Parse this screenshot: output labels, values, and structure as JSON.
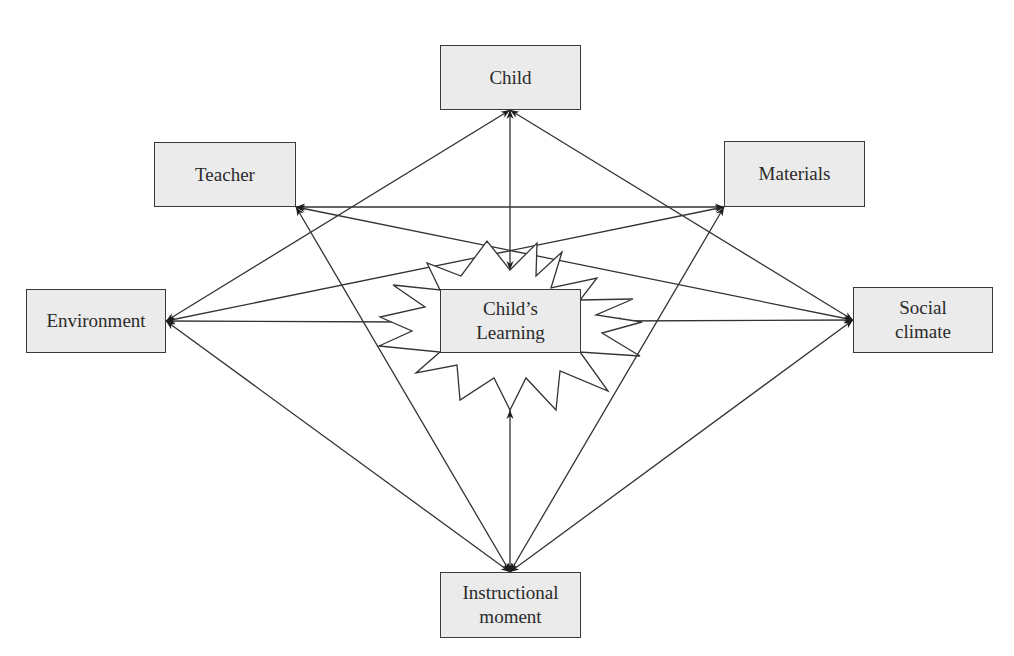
{
  "diagram": {
    "type": "concept-map",
    "center": {
      "id": "learning",
      "label": "Child’s\nLearning",
      "shape": "starburst"
    },
    "nodes": [
      {
        "id": "child",
        "label": "Child"
      },
      {
        "id": "teacher",
        "label": "Teacher"
      },
      {
        "id": "materials",
        "label": "Materials"
      },
      {
        "id": "environment",
        "label": "Environment"
      },
      {
        "id": "social",
        "label": "Social\nclimate"
      },
      {
        "id": "instructional",
        "label": "Instructional\nmoment"
      }
    ],
    "edges": [
      {
        "from": "child",
        "to": "learning",
        "direction": "both"
      },
      {
        "from": "child",
        "to": "environment",
        "direction": "both"
      },
      {
        "from": "child",
        "to": "social",
        "direction": "both"
      },
      {
        "from": "teacher",
        "to": "materials",
        "direction": "both"
      },
      {
        "from": "teacher",
        "to": "social",
        "direction": "both"
      },
      {
        "from": "materials",
        "to": "environment",
        "direction": "both"
      },
      {
        "from": "teacher",
        "to": "instructional",
        "direction": "both"
      },
      {
        "from": "materials",
        "to": "instructional",
        "direction": "both"
      },
      {
        "from": "environment",
        "to": "learning",
        "direction": "both"
      },
      {
        "from": "social",
        "to": "learning",
        "direction": "both"
      },
      {
        "from": "environment",
        "to": "instructional",
        "direction": "both"
      },
      {
        "from": "social",
        "to": "instructional",
        "direction": "both"
      },
      {
        "from": "instructional",
        "to": "learning",
        "direction": "both"
      }
    ],
    "colors": {
      "box_fill": "#ebebeb",
      "stroke": "#3a3a3a",
      "text": "#2a2a2a",
      "background": "#ffffff"
    }
  }
}
